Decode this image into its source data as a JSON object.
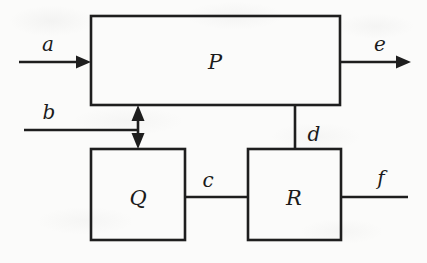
{
  "diagram": {
    "type": "block-diagram",
    "background_color": "#fbfbfa",
    "line_color": "#1e1e1e",
    "blocks": [
      {
        "id": "P",
        "label": "P",
        "x": 91,
        "y": 16,
        "width": 249,
        "height": 89,
        "label_x": 215,
        "label_y": 62
      },
      {
        "id": "Q",
        "label": "Q",
        "x": 91,
        "y": 149,
        "width": 94,
        "height": 91,
        "label_x": 138,
        "label_y": 198
      },
      {
        "id": "R",
        "label": "R",
        "x": 248,
        "y": 149,
        "width": 93,
        "height": 91,
        "label_x": 294,
        "label_y": 198
      }
    ],
    "signals": [
      {
        "id": "a",
        "label": "a",
        "label_x": 48,
        "label_y": 44,
        "kind": "input",
        "arrow": "single",
        "direction": "right",
        "from": "external",
        "to": "P"
      },
      {
        "id": "b",
        "label": "b",
        "label_x": 49,
        "label_y": 112,
        "kind": "input",
        "arrow": "none",
        "direction": "right",
        "from": "external",
        "to": "P-Q-link"
      },
      {
        "id": "c",
        "label": "c",
        "label_x": 208,
        "label_y": 180,
        "kind": "interconnect",
        "arrow": "none",
        "direction": "right",
        "from": "Q",
        "to": "R"
      },
      {
        "id": "d",
        "label": "d",
        "label_x": 314,
        "label_y": 134,
        "kind": "interconnect",
        "arrow": "none",
        "direction": "vertical",
        "from": "P",
        "to": "R"
      },
      {
        "id": "e",
        "label": "e",
        "label_x": 380,
        "label_y": 44,
        "kind": "output",
        "arrow": "single",
        "direction": "right",
        "from": "P",
        "to": "external"
      },
      {
        "id": "f",
        "label": "f",
        "label_x": 381,
        "label_y": 178,
        "kind": "output",
        "arrow": "none",
        "direction": "right",
        "from": "R",
        "to": "external"
      },
      {
        "id": "pq",
        "label": "",
        "label_x": 0,
        "label_y": 0,
        "kind": "interconnect",
        "arrow": "double",
        "direction": "vertical",
        "from": "P",
        "to": "Q"
      }
    ]
  }
}
